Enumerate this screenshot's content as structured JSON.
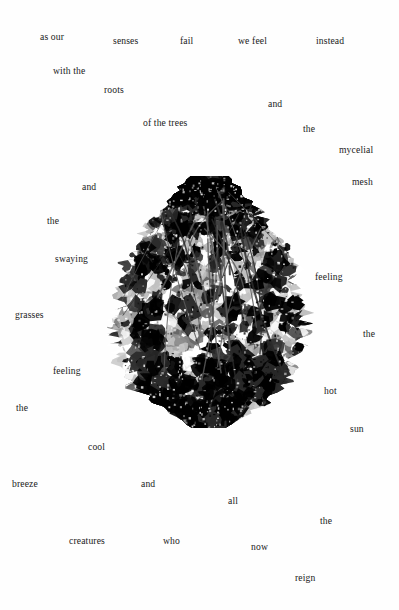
{
  "page": {
    "background_color": "#fefefe",
    "text_color": "#1a1a1a",
    "width": 399,
    "height": 610
  },
  "artwork": {
    "name": "foliage-collage",
    "description": "high-contrast black and white photographic cutout of leafy foliage / tree crown",
    "x": 104,
    "y": 176,
    "width": 210,
    "height": 252,
    "palette": [
      "#000000",
      "#2b2b2b",
      "#5a5a5a",
      "#8c8c8c",
      "#c0c0c0",
      "#ffffff"
    ]
  },
  "poem": {
    "full_text": "as our senses fail we feel instead with the roots of the trees and the mycelial mesh and the swaying grasses feeling the cool breeze and the hot sun and all creatures who now reign",
    "words": [
      {
        "text": "as our",
        "x": 40,
        "y": 32
      },
      {
        "text": "senses",
        "x": 113,
        "y": 36
      },
      {
        "text": "fail",
        "x": 180,
        "y": 36
      },
      {
        "text": "we feel",
        "x": 238,
        "y": 36
      },
      {
        "text": "instead",
        "x": 316,
        "y": 36
      },
      {
        "text": "with the",
        "x": 53,
        "y": 66
      },
      {
        "text": "roots",
        "x": 104,
        "y": 85
      },
      {
        "text": "and",
        "x": 268,
        "y": 99
      },
      {
        "text": "of the trees",
        "x": 143,
        "y": 118
      },
      {
        "text": "the",
        "x": 303,
        "y": 124
      },
      {
        "text": "mycelial",
        "x": 339,
        "y": 145
      },
      {
        "text": "mesh",
        "x": 352,
        "y": 177
      },
      {
        "text": "and",
        "x": 82,
        "y": 182
      },
      {
        "text": "the",
        "x": 47,
        "y": 216
      },
      {
        "text": "swaying",
        "x": 55,
        "y": 254
      },
      {
        "text": "feeling",
        "x": 315,
        "y": 272
      },
      {
        "text": "grasses",
        "x": 15,
        "y": 310
      },
      {
        "text": "the",
        "x": 363,
        "y": 329
      },
      {
        "text": "feeling",
        "x": 53,
        "y": 366
      },
      {
        "text": "hot",
        "x": 324,
        "y": 386
      },
      {
        "text": "the",
        "x": 16,
        "y": 403
      },
      {
        "text": "sun",
        "x": 350,
        "y": 424
      },
      {
        "text": "cool",
        "x": 88,
        "y": 442
      },
      {
        "text": "breeze",
        "x": 12,
        "y": 479
      },
      {
        "text": "and",
        "x": 141,
        "y": 479
      },
      {
        "text": "all",
        "x": 228,
        "y": 496
      },
      {
        "text": "the",
        "x": 320,
        "y": 516
      },
      {
        "text": "creatures",
        "x": 69,
        "y": 536
      },
      {
        "text": "who",
        "x": 163,
        "y": 536
      },
      {
        "text": "now",
        "x": 251,
        "y": 542
      },
      {
        "text": "reign",
        "x": 295,
        "y": 573
      }
    ]
  }
}
